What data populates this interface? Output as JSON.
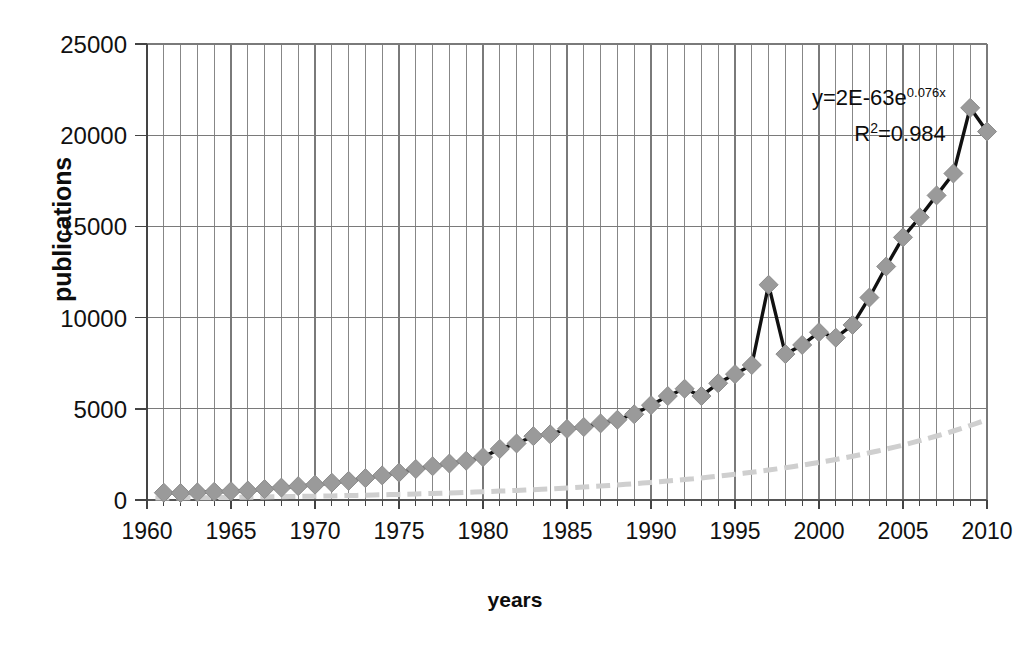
{
  "axes": {
    "y_label": "publications",
    "x_label": "years",
    "y_ticks": [
      0,
      5000,
      10000,
      15000,
      20000,
      25000
    ],
    "y_tick_labels": [
      "0",
      "5000",
      "10000",
      "15000",
      "20000",
      "25000"
    ],
    "x_ticks": [
      1960,
      1965,
      1970,
      1975,
      1980,
      1985,
      1990,
      1995,
      2000,
      2005,
      2010
    ],
    "x_tick_labels": [
      "1960",
      "1965",
      "1970",
      "1975",
      "1980",
      "1985",
      "1990",
      "1995",
      "2000",
      "2005",
      "2010"
    ]
  },
  "annotation": {
    "equation_prefix": "y=2E-63e",
    "equation_exponent": "0.076x",
    "r2_label": "R",
    "r2_sup": "2",
    "r2_value": "=0.984"
  },
  "style": {
    "line_color": "#111111",
    "marker_color": "#9a9a9a",
    "marker_edge": "#8c8c8c",
    "trend_color": "#cfcfcf",
    "grid_color": "#7a7a7a",
    "axis_color": "#555555",
    "background": "#ffffff"
  },
  "chart_data": {
    "type": "line",
    "title": "",
    "xlabel": "years",
    "ylabel": "publications",
    "xlim": [
      1960,
      2010
    ],
    "ylim": [
      0,
      25000
    ],
    "grid": "vertical-yearly-and-horizontal-major",
    "legend": "none",
    "annotations": [
      "y=2E-63e^0.076x",
      "R²=0.984"
    ],
    "trendline": {
      "type": "exponential",
      "equation": "y=2E-63e^(0.076x)",
      "r_squared": 0.984,
      "style": "dashed-light-gray"
    },
    "x": [
      1961,
      1962,
      1963,
      1964,
      1965,
      1966,
      1967,
      1968,
      1969,
      1970,
      1971,
      1972,
      1973,
      1974,
      1975,
      1976,
      1977,
      1978,
      1979,
      1980,
      1981,
      1982,
      1983,
      1984,
      1985,
      1986,
      1987,
      1988,
      1989,
      1990,
      1991,
      1992,
      1993,
      1994,
      1995,
      1996,
      1997,
      1998,
      1999,
      2000,
      2001,
      2002,
      2003,
      2004,
      2005,
      2006,
      2007,
      2008,
      2009,
      2010
    ],
    "values": [
      400,
      380,
      420,
      450,
      480,
      520,
      600,
      680,
      760,
      840,
      950,
      1050,
      1200,
      1350,
      1500,
      1700,
      1850,
      2000,
      2150,
      2350,
      2800,
      3100,
      3500,
      3600,
      3900,
      4000,
      4200,
      4400,
      4700,
      5200,
      5700,
      6100,
      5700,
      6400,
      6900,
      7400,
      11800,
      8000,
      8500,
      9200,
      8900,
      9600,
      11100,
      12800,
      14400,
      15500,
      16700,
      17900,
      21500,
      20200
    ]
  }
}
